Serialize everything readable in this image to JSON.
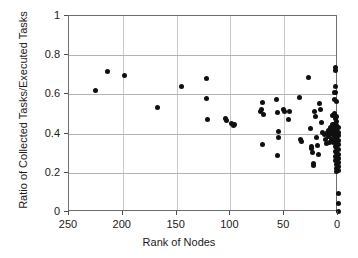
{
  "chart_data": {
    "type": "scatter",
    "title": "",
    "xlabel": "Rank of Nodes",
    "ylabel": "Ratio of Collected Tasks/Executed Tasks",
    "xlim": [
      250,
      0
    ],
    "ylim": [
      0,
      1
    ],
    "x_reversed": true,
    "xticks": [
      250,
      200,
      150,
      100,
      50,
      0
    ],
    "xtick_labels": [
      "250",
      "200",
      "150",
      "100",
      "50",
      "0"
    ],
    "yticks": [
      0,
      0.2,
      0.4,
      0.6,
      0.8,
      1
    ],
    "ytick_labels": [
      "0",
      "0.2",
      "0.4",
      "0.6",
      "0.8",
      "1"
    ],
    "grid": true,
    "grid_axes": "both",
    "legend": null,
    "marker": "filled-circle",
    "marker_color": "#101010",
    "marker_size": 5,
    "points": [
      [
        225,
        0.62
      ],
      [
        214,
        0.715
      ],
      [
        198,
        0.695
      ],
      [
        168,
        0.535
      ],
      [
        145,
        0.638
      ],
      [
        122,
        0.68
      ],
      [
        122,
        0.578
      ],
      [
        121,
        0.472
      ],
      [
        105,
        0.475
      ],
      [
        104,
        0.468
      ],
      [
        99,
        0.45
      ],
      [
        97,
        0.443
      ],
      [
        96,
        0.448
      ],
      [
        72,
        0.515
      ],
      [
        71,
        0.525
      ],
      [
        70,
        0.558
      ],
      [
        69,
        0.495
      ],
      [
        70,
        0.345
      ],
      [
        57,
        0.572
      ],
      [
        56,
        0.508
      ],
      [
        55,
        0.412
      ],
      [
        55,
        0.378
      ],
      [
        56,
        0.287
      ],
      [
        51,
        0.522
      ],
      [
        50,
        0.512
      ],
      [
        46,
        0.472
      ],
      [
        45,
        0.512
      ],
      [
        36,
        0.582
      ],
      [
        35,
        0.368
      ],
      [
        34,
        0.362
      ],
      [
        27,
        0.685
      ],
      [
        26,
        0.425
      ],
      [
        25,
        0.335
      ],
      [
        25,
        0.322
      ],
      [
        24,
        0.305
      ],
      [
        23,
        0.248
      ],
      [
        23,
        0.235
      ],
      [
        22,
        0.512
      ],
      [
        21,
        0.488
      ],
      [
        20,
        0.382
      ],
      [
        19,
        0.338
      ],
      [
        18,
        0.295
      ],
      [
        17,
        0.552
      ],
      [
        16,
        0.522
      ],
      [
        15,
        0.458
      ],
      [
        14,
        0.408
      ],
      [
        13,
        0.395
      ],
      [
        12,
        0.372
      ],
      [
        11,
        0.348
      ],
      [
        10,
        0.405
      ],
      [
        9,
        0.418
      ],
      [
        9,
        0.385
      ],
      [
        8,
        0.402
      ],
      [
        8,
        0.355
      ],
      [
        7,
        0.432
      ],
      [
        7,
        0.398
      ],
      [
        6,
        0.415
      ],
      [
        6,
        0.372
      ],
      [
        5,
        0.492
      ],
      [
        5,
        0.445
      ],
      [
        5,
        0.408
      ],
      [
        4,
        0.425
      ],
      [
        4,
        0.392
      ],
      [
        4,
        0.355
      ],
      [
        3,
        0.612
      ],
      [
        3,
        0.572
      ],
      [
        3,
        0.502
      ],
      [
        3,
        0.438
      ],
      [
        3,
        0.412
      ],
      [
        2,
        0.735
      ],
      [
        2,
        0.722
      ],
      [
        2,
        0.638
      ],
      [
        2,
        0.608
      ],
      [
        2,
        0.478
      ],
      [
        2,
        0.452
      ],
      [
        2,
        0.428
      ],
      [
        2,
        0.405
      ],
      [
        2,
        0.382
      ],
      [
        2,
        0.358
      ],
      [
        2,
        0.332
      ],
      [
        2,
        0.308
      ],
      [
        2,
        0.282
      ],
      [
        2,
        0.262
      ],
      [
        1,
        0.565
      ],
      [
        1,
        0.488
      ],
      [
        1,
        0.462
      ],
      [
        1,
        0.442
      ],
      [
        1,
        0.418
      ],
      [
        1,
        0.398
      ],
      [
        1,
        0.375
      ],
      [
        1,
        0.352
      ],
      [
        1,
        0.328
      ],
      [
        1,
        0.305
      ],
      [
        1,
        0.285
      ],
      [
        1,
        0.265
      ],
      [
        1,
        0.242
      ],
      [
        1,
        0.222
      ],
      [
        1,
        0.205
      ],
      [
        0,
        0.432
      ],
      [
        0,
        0.408
      ],
      [
        0,
        0.388
      ],
      [
        0,
        0.365
      ],
      [
        0,
        0.342
      ],
      [
        0,
        0.318
      ],
      [
        0,
        0.295
      ],
      [
        0,
        0.275
      ],
      [
        0,
        0.252
      ],
      [
        0,
        0.232
      ],
      [
        0,
        0.212
      ],
      [
        0,
        0.095
      ],
      [
        0,
        0.042
      ],
      [
        0,
        0.005
      ]
    ]
  }
}
